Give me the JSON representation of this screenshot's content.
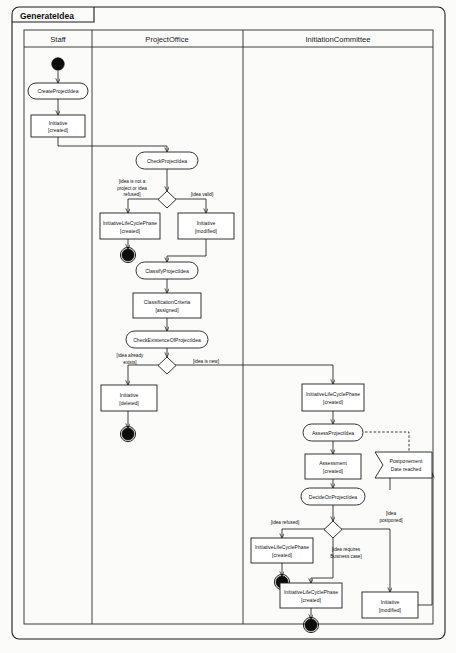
{
  "diagram": {
    "title": "GenerateIdea",
    "type": "uml-activity-diagram",
    "lanes": [
      {
        "id": "staff",
        "label": "Staff"
      },
      {
        "id": "projectoffice",
        "label": "ProjectOffice"
      },
      {
        "id": "initiationcommittee",
        "label": "InitiationCommittee"
      }
    ],
    "nodes": {
      "start": {
        "kind": "initial-node",
        "lane": "staff"
      },
      "create_project_idea": {
        "kind": "action",
        "lane": "staff",
        "label": "CreateProjectIdea"
      },
      "initiative_created": {
        "kind": "object",
        "lane": "staff",
        "label_line1": "Initiative",
        "label_line2": "[created]"
      },
      "check_project_idea": {
        "kind": "action",
        "lane": "projectoffice",
        "label": "CheckProjectIdea"
      },
      "decision_check": {
        "kind": "decision",
        "lane": "projectoffice"
      },
      "ilcp_created_po": {
        "kind": "object",
        "lane": "projectoffice",
        "label_line1": "InitiativeLifeCyclePhase",
        "label_line2": "[created]"
      },
      "initiative_modified_po": {
        "kind": "object",
        "lane": "projectoffice",
        "label_line1": "Initiative",
        "label_line2": "[modified]"
      },
      "end_po_refused": {
        "kind": "final-node",
        "lane": "projectoffice"
      },
      "classify_project_idea": {
        "kind": "action",
        "lane": "projectoffice",
        "label": "ClassifyProjectIdea"
      },
      "classification_criteria": {
        "kind": "object",
        "lane": "projectoffice",
        "label_line1": "ClassificationCriteria",
        "label_line2": "[assigned]"
      },
      "check_existence": {
        "kind": "action",
        "lane": "projectoffice",
        "label": "CheckExistenceOfProjectIdea"
      },
      "decision_existence": {
        "kind": "decision",
        "lane": "projectoffice"
      },
      "initiative_deleted": {
        "kind": "object",
        "lane": "projectoffice",
        "label_line1": "Initiative",
        "label_line2": "[deleted]"
      },
      "end_po_exists": {
        "kind": "final-node",
        "lane": "projectoffice"
      },
      "ilcp_created_ic": {
        "kind": "object",
        "lane": "initiationcommittee",
        "label_line1": "InitiativeLifeCyclePhase",
        "label_line2": "[created]"
      },
      "assess_project_idea": {
        "kind": "action",
        "lane": "initiationcommittee",
        "label": "AssessProjectIdea"
      },
      "assessment_created": {
        "kind": "object",
        "lane": "initiationcommittee",
        "label_line1": "Assessment",
        "label_line2": "[created]"
      },
      "decide_on_project_idea": {
        "kind": "action",
        "lane": "initiationcommittee",
        "label": "DecideOnProjectIdea"
      },
      "decision_decide": {
        "kind": "decision",
        "lane": "initiationcommittee"
      },
      "postponement_signal": {
        "kind": "accept-event",
        "lane": "initiationcommittee",
        "label_line1": "Postponement",
        "label_line2": "Date reached"
      },
      "ilcp_refused": {
        "kind": "object",
        "lane": "initiationcommittee",
        "label_line1": "InitiativeLifeCyclePhase",
        "label_line2": "[created]"
      },
      "end_ic_refused": {
        "kind": "final-node",
        "lane": "initiationcommittee"
      },
      "ilcp_business_case": {
        "kind": "object",
        "lane": "initiationcommittee",
        "label_line1": "InitiativeLifeCyclePhase",
        "label_line2": "[created]"
      },
      "end_ic_business": {
        "kind": "final-node",
        "lane": "initiationcommittee"
      },
      "initiative_modified_ic": {
        "kind": "object",
        "lane": "initiationcommittee",
        "label_line1": "Initiative",
        "label_line2": "[modified]"
      }
    },
    "guards": {
      "not_project": {
        "line1": "[idea is not a",
        "line2": "project or idea",
        "line3": "refused]"
      },
      "idea_valid": {
        "line1": "[idea valid]"
      },
      "idea_exists": {
        "line1": "[idea already",
        "line2": "exists]"
      },
      "idea_new": {
        "line1": "[idea is new]"
      },
      "idea_refused": {
        "line1": "[idea refused]"
      },
      "idea_business": {
        "line1": "[idea requires",
        "line2": "Business case]"
      },
      "idea_postponed": {
        "line1": "[idea",
        "line2": "postponed]"
      }
    },
    "colors": {
      "stroke": "#1d1d1d",
      "fill": "#ffffff",
      "background": "#fbfbfa",
      "node_solid": "#0d0d0d"
    }
  }
}
